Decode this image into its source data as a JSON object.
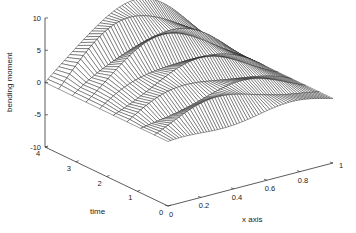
{
  "chart_data": {
    "type": "surface3d_mesh",
    "title": "",
    "xlabel": "x axis",
    "ylabel": "time",
    "zlabel": "bending moment",
    "xlim": [
      0,
      1
    ],
    "ylim": [
      0,
      4
    ],
    "zlim": [
      -10,
      10
    ],
    "x_ticks": [
      "0",
      "0.2",
      "0.4",
      "0.6",
      "0.8",
      "1"
    ],
    "y_ticks": [
      "0",
      "1",
      "2",
      "3",
      "4"
    ],
    "z_ticks": [
      "-10",
      "-5",
      "0",
      "5",
      "10"
    ],
    "grid": false,
    "surface": {
      "description": "Bending moment vs x position and time; zero at x=0 and x=1, peaks near 9 mid-span at later times, with travelling ripples",
      "x": [
        0,
        0.05,
        0.1,
        0.15,
        0.2,
        0.25,
        0.3,
        0.35,
        0.4,
        0.45,
        0.5,
        0.55,
        0.6,
        0.65,
        0.7,
        0.75,
        0.8,
        0.85,
        0.9,
        0.95,
        1.0
      ],
      "t": [
        0,
        0.5,
        1.0,
        1.5,
        2.0,
        2.5,
        3.0,
        3.5,
        4.0
      ],
      "z_peak_by_t": [
        1.0,
        3.0,
        2.5,
        4.5,
        4.0,
        6.5,
        6.0,
        8.0,
        8.5
      ]
    }
  },
  "labels": {
    "z_axis": "bending moment",
    "t_axis": "time",
    "x_axis": "x axis"
  }
}
